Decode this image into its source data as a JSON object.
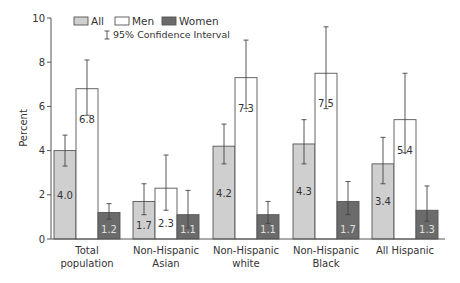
{
  "chart_data": {
    "type": "bar",
    "title": "",
    "xlabel": "",
    "ylabel": "Percent",
    "ylim": [
      0,
      10
    ],
    "yticks": [
      0,
      2,
      4,
      6,
      8,
      10
    ],
    "grid": false,
    "legend_position": "top-left inside",
    "categories": [
      [
        "Total",
        "population"
      ],
      [
        "Non-Hispanic",
        "Asian"
      ],
      [
        "Non-Hispanic",
        "white"
      ],
      [
        "Non-Hispanic",
        "Black"
      ],
      [
        "All Hispanic"
      ]
    ],
    "series": [
      {
        "name": "All",
        "color": "#cfcfcf",
        "label_color": "#333333",
        "values": [
          4.0,
          1.7,
          4.2,
          4.3,
          3.4
        ],
        "ci_low": [
          3.3,
          1.1,
          3.4,
          3.4,
          2.5
        ],
        "ci_high": [
          4.7,
          2.5,
          5.2,
          5.4,
          4.6
        ]
      },
      {
        "name": "Men",
        "color": "#ffffff",
        "label_color": "#333333",
        "values": [
          6.8,
          2.3,
          7.3,
          7.5,
          5.4
        ],
        "ci_low": [
          5.6,
          1.3,
          5.9,
          5.9,
          3.9
        ],
        "ci_high": [
          8.1,
          3.8,
          9.0,
          9.6,
          7.5
        ]
      },
      {
        "name": "Women",
        "color": "#6b6b6b",
        "label_color": "#e0e0e0",
        "values": [
          1.2,
          1.1,
          1.1,
          1.7,
          1.3
        ],
        "ci_low": [
          0.9,
          0.5,
          0.7,
          1.1,
          0.8
        ],
        "ci_high": [
          1.6,
          2.2,
          1.7,
          2.6,
          2.4
        ]
      }
    ],
    "legend": {
      "entries": [
        "All",
        "Men",
        "Women"
      ],
      "ci_note": "95% Confidence Interval",
      "ci_symbol": "I"
    }
  }
}
